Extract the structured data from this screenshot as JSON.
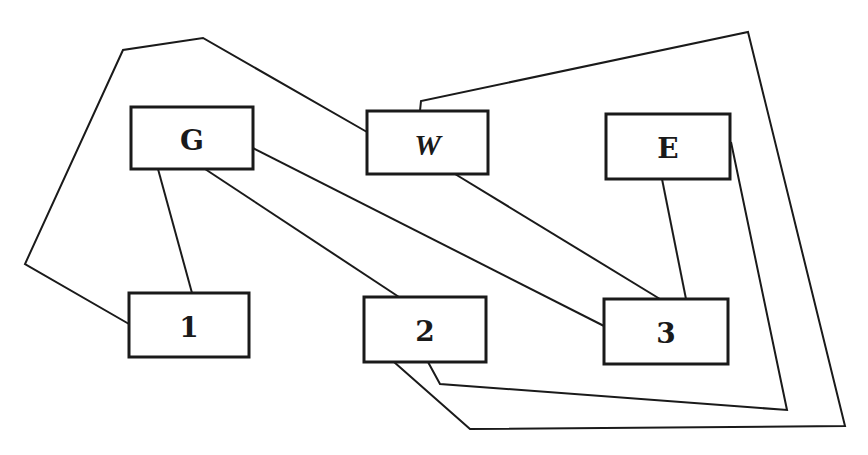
{
  "diagram": {
    "type": "graph",
    "stroke_color": "#1a1a1a",
    "background": "#ffffff",
    "nodes": [
      {
        "id": "G",
        "label": "G",
        "x": 131,
        "y": 107,
        "w": 122,
        "h": 62
      },
      {
        "id": "W",
        "label": "W",
        "x": 367,
        "y": 111,
        "w": 121,
        "h": 63
      },
      {
        "id": "E",
        "label": "E",
        "x": 606,
        "y": 114,
        "w": 124,
        "h": 65
      },
      {
        "id": "1",
        "label": "1",
        "x": 129,
        "y": 293,
        "w": 120,
        "h": 64
      },
      {
        "id": "2",
        "label": "2",
        "x": 364,
        "y": 297,
        "w": 122,
        "h": 65
      },
      {
        "id": "3",
        "label": "3",
        "x": 604,
        "y": 299,
        "w": 124,
        "h": 65
      }
    ],
    "edges": [
      {
        "from": "1",
        "to": "W",
        "points": "129,324 25,264 123,50 203,38 367,132"
      },
      {
        "from": "G",
        "to": "1",
        "points": "158,169 192,293"
      },
      {
        "from": "G",
        "to": "2",
        "points": "205,169 399,297"
      },
      {
        "from": "G",
        "to": "3",
        "points": "253,148 604,326"
      },
      {
        "from": "W",
        "to": "3",
        "points": "455,174 660,299"
      },
      {
        "from": "E",
        "to": "3",
        "points": "662,179 686,299"
      },
      {
        "from": "W",
        "to": "2",
        "points": "420,111 421,101 748,32 845,426 470,429 394,362"
      },
      {
        "from": "E",
        "to": "2",
        "points": "731,142 787,410 440,384 428,362"
      }
    ]
  }
}
